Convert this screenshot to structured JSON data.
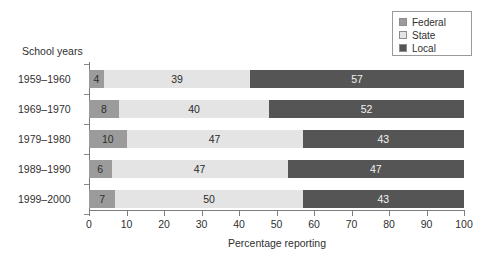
{
  "chart_data": {
    "type": "bar",
    "orientation": "horizontal",
    "stacked": true,
    "title": "",
    "xlabel": "Percentage reporting",
    "ylabel": "School years",
    "categories": [
      "1959–1960",
      "1969–1970",
      "1979–1980",
      "1989–1990",
      "1999–2000"
    ],
    "series": [
      {
        "name": "Federal",
        "color": "#9b9b9b",
        "values": [
          4,
          8,
          10,
          6,
          7
        ]
      },
      {
        "name": "State",
        "color": "#e4e4e4",
        "values": [
          39,
          40,
          47,
          47,
          50
        ]
      },
      {
        "name": "Local",
        "color": "#555555",
        "values": [
          57,
          52,
          43,
          47,
          43
        ]
      }
    ],
    "xlim": [
      0,
      100
    ],
    "xticks": [
      "0",
      "10",
      "20",
      "30",
      "40",
      "50",
      "60",
      "70",
      "80",
      "90",
      "100"
    ],
    "grid": false,
    "legend_position": "top-right"
  },
  "legend": {
    "items": [
      {
        "label": "Federal",
        "color": "#9b9b9b"
      },
      {
        "label": "State",
        "color": "#e4e4e4"
      },
      {
        "label": "Local",
        "color": "#555555"
      }
    ]
  },
  "axes": {
    "y_group_title": "School years",
    "x_title": "Percentage reporting"
  }
}
